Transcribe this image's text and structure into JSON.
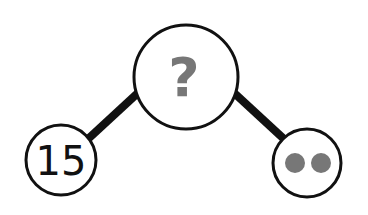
{
  "diagram": {
    "type": "number-bond",
    "whole": {
      "label": "?",
      "color": "#777777"
    },
    "parts": [
      {
        "kind": "number",
        "label": "15",
        "color": "#111111"
      },
      {
        "kind": "dots",
        "count": 2,
        "color": "#777777"
      }
    ],
    "line_color": "#111111",
    "stroke_color": "#111111"
  }
}
